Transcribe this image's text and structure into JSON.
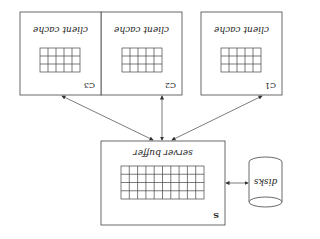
{
  "diagram": {
    "orientation": "rotated-180",
    "colors": {
      "stroke": "#444444",
      "text": "#222222",
      "background": "#ffffff"
    },
    "clients": [
      {
        "id": "C1",
        "label": "client cache",
        "tag": "C1",
        "grid": {
          "cols": 5,
          "rows": 3
        }
      },
      {
        "id": "C2",
        "label": "client cache",
        "tag": "C2",
        "grid": {
          "cols": 5,
          "rows": 3
        }
      },
      {
        "id": "C3",
        "label": "client cache",
        "tag": "C3",
        "grid": {
          "cols": 5,
          "rows": 3
        }
      }
    ],
    "server": {
      "id": "S",
      "label": "server buffer",
      "tag": "S",
      "grid": {
        "cols": 10,
        "rows": 4
      }
    },
    "disks": {
      "label": "disks"
    },
    "edges": [
      {
        "from": "C1",
        "to": "S",
        "bidirectional": true
      },
      {
        "from": "C2",
        "to": "S",
        "bidirectional": true
      },
      {
        "from": "C3",
        "to": "S",
        "bidirectional": true
      },
      {
        "from": "S",
        "to": "disks",
        "bidirectional": true
      }
    ]
  }
}
